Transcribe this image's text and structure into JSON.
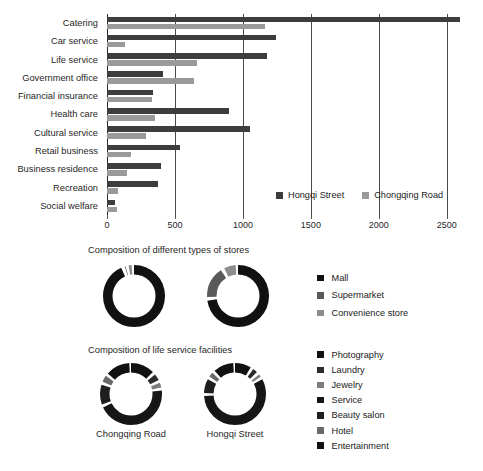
{
  "colors": {
    "dark": "#3d3d3d",
    "light": "#9a9a9a",
    "black": "#111111",
    "gray_mid": "#5a5a5a",
    "gray_soft": "#8c8c8c",
    "grid": "#4a4a4a",
    "text": "#1f1f1f",
    "ring_track": "#ffffff"
  },
  "chart_data": [
    {
      "type": "bar",
      "orientation": "horizontal",
      "title": "",
      "xlabel": "",
      "ylabel": "",
      "xlim": [
        0,
        2700
      ],
      "grid": true,
      "grid_axis": "x",
      "legend_position": "bottom-right",
      "ticks": [
        0,
        500,
        1000,
        1500,
        2000,
        2500
      ],
      "tick_labels": [
        "0",
        "500",
        "1000",
        "1500",
        "2000",
        "2500"
      ],
      "categories": [
        "Catering",
        "Car service",
        "Life service",
        "Government office",
        "Financial insurance",
        "Health care",
        "Cultural service",
        "Retail business",
        "Business residence",
        "Recreation",
        "Social welfare"
      ],
      "series": [
        {
          "name": "Hongqi Street",
          "color": "#3d3d3d",
          "values": [
            2600,
            1240,
            1180,
            415,
            340,
            900,
            1050,
            540,
            395,
            375,
            58
          ]
        },
        {
          "name": "Chongqing Road",
          "color": "#9a9a9a",
          "values": [
            1160,
            135,
            660,
            640,
            330,
            355,
            285,
            175,
            145,
            80,
            72
          ]
        }
      ]
    },
    {
      "type": "pie",
      "variant": "donut",
      "title": "Composition of different types of stores",
      "legend_position": "right",
      "legend_labels": [
        "Mall",
        "Supermarket",
        "Convenience store"
      ],
      "legend_colors": [
        "#111111",
        "#5a5a5a",
        "#8c8c8c"
      ],
      "panels": [
        {
          "name": "Chongqing Road",
          "labels": [
            "Mall",
            "Supermarket",
            "Convenience store"
          ],
          "values": [
            94.5,
            2.0,
            3.5
          ],
          "colors": [
            "#111111",
            "#5a5a5a",
            "#8c8c8c"
          ]
        },
        {
          "name": "Hongqi Street",
          "labels": [
            "Mall",
            "Supermarket",
            "Convenience store"
          ],
          "values": [
            74.0,
            18.0,
            8.0
          ],
          "colors": [
            "#111111",
            "#5a5a5a",
            "#8c8c8c"
          ]
        }
      ]
    },
    {
      "type": "pie",
      "variant": "donut",
      "title": "Composition of life service facilities",
      "legend_position": "right",
      "legend_labels": [
        "Photography",
        "Laundry",
        "Jewelry",
        "Service",
        "Beauty salon",
        "Hotel",
        "Entertainment"
      ],
      "legend_colors": [
        "#111111",
        "#2b2b2b",
        "#7d7d7d",
        "#161616",
        "#1f1f1f",
        "#6a6a6a",
        "#111111"
      ],
      "panels": [
        {
          "name": "Chongqing Road",
          "labels": [
            "Photography",
            "Laundry",
            "Jewelry",
            "Service",
            "Beauty salon",
            "Hotel",
            "Entertainment"
          ],
          "values": [
            14.0,
            5.0,
            4.0,
            46.0,
            12.0,
            5.0,
            14.0
          ],
          "colors": [
            "#111111",
            "#2b2b2b",
            "#7d7d7d",
            "#161616",
            "#1f1f1f",
            "#6a6a6a",
            "#111111"
          ]
        },
        {
          "name": "Hongqi Street",
          "labels": [
            "Photography",
            "Laundry",
            "Jewelry",
            "Service",
            "Beauty salon",
            "Hotel",
            "Entertainment"
          ],
          "values": [
            10.0,
            4.0,
            3.0,
            58.0,
            9.0,
            4.0,
            12.0
          ],
          "colors": [
            "#111111",
            "#2b2b2b",
            "#7d7d7d",
            "#161616",
            "#1f1f1f",
            "#6a6a6a",
            "#111111"
          ]
        }
      ]
    }
  ],
  "bar_legend": {
    "items": [
      {
        "label": "Hongqi Street",
        "color": "#3d3d3d"
      },
      {
        "label": "Chongqing Road",
        "color": "#9a9a9a"
      }
    ]
  },
  "donut_section_1": {
    "title": "Composition of different types of stores",
    "legend": [
      {
        "label": "Mall",
        "color": "#111111"
      },
      {
        "label": "Supermarket",
        "color": "#5a5a5a"
      },
      {
        "label": "Convenience store",
        "color": "#8c8c8c"
      }
    ]
  },
  "donut_section_2": {
    "title": "Composition of life service facilities",
    "legend": [
      {
        "label": "Photography",
        "color": "#111111"
      },
      {
        "label": "Laundry",
        "color": "#2b2b2b"
      },
      {
        "label": "Jewelry",
        "color": "#7d7d7d"
      },
      {
        "label": "Service",
        "color": "#161616"
      },
      {
        "label": "Beauty salon",
        "color": "#1f1f1f"
      },
      {
        "label": "Hotel",
        "color": "#6a6a6a"
      },
      {
        "label": "Entertainment",
        "color": "#111111"
      }
    ],
    "captions": [
      "Chongqing Road",
      "Hongqi Street"
    ]
  },
  "caption": ""
}
